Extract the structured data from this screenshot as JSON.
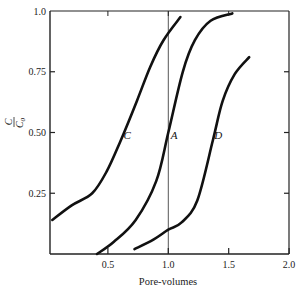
{
  "chart_data": {
    "type": "line",
    "title": "",
    "xlabel": "Pore-volumes",
    "ylabel": "C/C0",
    "ylabel_parts": {
      "numerator": "C",
      "denominator": "C",
      "subscript": "0"
    },
    "xlim": [
      0,
      2.0
    ],
    "ylim": [
      0,
      1.0
    ],
    "x_ticks": [
      0.5,
      1.0,
      1.5,
      2.0
    ],
    "x_tick_labels": [
      "0.5",
      "1.0",
      "1.5",
      "2.0"
    ],
    "y_ticks": [
      0.25,
      0.5,
      0.75,
      1.0
    ],
    "y_tick_labels": [
      "0.25",
      "0.50",
      "0.75",
      "1.0"
    ],
    "grid": false,
    "legend": "none",
    "reference_line": {
      "orientation": "vertical",
      "x": 1.0
    },
    "series": [
      {
        "name": "C",
        "label_at": [
          0.63,
          0.49
        ],
        "points": [
          [
            0.04,
            0.14
          ],
          [
            0.2,
            0.2
          ],
          [
            0.37,
            0.25
          ],
          [
            0.49,
            0.34
          ],
          [
            0.6,
            0.46
          ],
          [
            0.74,
            0.63
          ],
          [
            0.85,
            0.77
          ],
          [
            0.96,
            0.88
          ],
          [
            1.1,
            0.975
          ]
        ]
      },
      {
        "name": "A",
        "label_at": [
          1.02,
          0.49
        ],
        "points": [
          [
            0.41,
            0.0
          ],
          [
            0.55,
            0.05
          ],
          [
            0.73,
            0.14
          ],
          [
            0.9,
            0.3
          ],
          [
            1.0,
            0.5
          ],
          [
            1.12,
            0.75
          ],
          [
            1.22,
            0.88
          ],
          [
            1.35,
            0.96
          ],
          [
            1.53,
            0.99
          ]
        ]
      },
      {
        "name": "D",
        "label_at": [
          1.38,
          0.49
        ],
        "points": [
          [
            0.72,
            0.02
          ],
          [
            0.88,
            0.06
          ],
          [
            1.0,
            0.1
          ],
          [
            1.11,
            0.13
          ],
          [
            1.24,
            0.22
          ],
          [
            1.37,
            0.47
          ],
          [
            1.45,
            0.63
          ],
          [
            1.55,
            0.74
          ],
          [
            1.67,
            0.81
          ]
        ]
      }
    ]
  }
}
